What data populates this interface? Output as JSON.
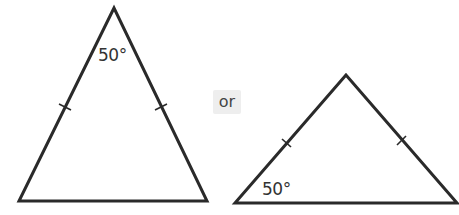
{
  "diagram": {
    "stroke_color": "#2a2a2a",
    "background": "#ffffff",
    "left_triangle": {
      "type": "isosceles",
      "vertices": {
        "apex": [
          114,
          8
        ],
        "base_left": [
          19,
          201
        ],
        "base_right": [
          207,
          201
        ]
      },
      "equal_side_ticks": 2,
      "angle_label": "50°",
      "angle_location": "apex"
    },
    "separator": {
      "text": "or",
      "background": "#eeeeee"
    },
    "right_triangle": {
      "type": "isosceles",
      "vertices": {
        "apex": [
          346,
          75
        ],
        "base_left": [
          235,
          203
        ],
        "base_right": [
          457,
          203
        ]
      },
      "equal_side_ticks": 2,
      "angle_label": "50°",
      "angle_location": "base_left"
    }
  }
}
